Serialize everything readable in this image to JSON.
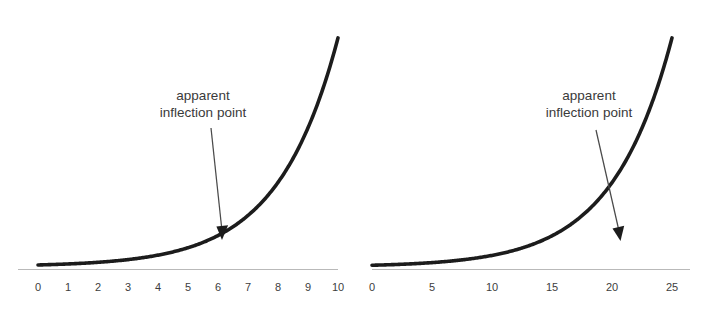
{
  "figure": {
    "background_color": "#ffffff",
    "curve_color": "#1c1c1c",
    "axis_color": "#b9b9b9",
    "arrow_color": "#4a4a4a",
    "text_color": "#3a3a3a"
  },
  "chart_data": [
    {
      "type": "line",
      "panel": "left",
      "title": "",
      "xlabel": "",
      "ylabel": "",
      "grid": false,
      "legend": null,
      "xlim": [
        0,
        10
      ],
      "ylim": [
        0,
        160
      ],
      "tick_labels": [
        "0",
        "1",
        "2",
        "3",
        "4",
        "5",
        "6",
        "7",
        "8",
        "9",
        "10"
      ],
      "tick_values": [
        0,
        1,
        2,
        3,
        4,
        5,
        6,
        7,
        8,
        9,
        10
      ],
      "x": [
        0,
        1,
        2,
        3,
        4,
        5,
        6,
        7,
        8,
        9,
        10
      ],
      "values": [
        1,
        1.6,
        2.6,
        4.3,
        7.0,
        11.4,
        18.7,
        30.5,
        50.0,
        81.7,
        148.4
      ],
      "annotations": [
        {
          "text_line1": "apparent",
          "text_line2": "inflection point",
          "points_at_x": 7,
          "arrow_from": [
            6.4,
            96
          ],
          "arrow_to": [
            6.85,
            33
          ]
        }
      ]
    },
    {
      "type": "line",
      "panel": "right",
      "title": "",
      "xlabel": "",
      "ylabel": "",
      "grid": false,
      "legend": null,
      "xlim": [
        0,
        25
      ],
      "ylim": [
        0,
        160
      ],
      "tick_labels": [
        "0",
        "5",
        "10",
        "15",
        "20",
        "25"
      ],
      "tick_values": [
        0,
        5,
        10,
        15,
        20,
        25
      ],
      "x": [
        0,
        5,
        10,
        15,
        20,
        25
      ],
      "values": [
        1,
        1.6,
        2.6,
        7.0,
        18.7,
        148.4
      ],
      "annotations": [
        {
          "text_line1": "apparent",
          "text_line2": "inflection point",
          "points_at_x": 20,
          "arrow_from": [
            16.2,
            96
          ],
          "arrow_to": [
            18.0,
            33
          ]
        }
      ]
    }
  ],
  "left_chart": {
    "ticks": [
      "0",
      "1",
      "2",
      "3",
      "4",
      "5",
      "6",
      "7",
      "8",
      "9",
      "10"
    ],
    "annotation": {
      "line1": "apparent",
      "line2": "inflection point"
    }
  },
  "right_chart": {
    "ticks": [
      "0",
      "5",
      "10",
      "15",
      "20",
      "25"
    ],
    "annotation": {
      "line1": "apparent",
      "line2": "inflection point"
    }
  }
}
